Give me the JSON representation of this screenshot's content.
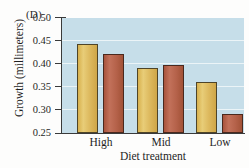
{
  "panel": {
    "letter": "(D)"
  },
  "chart_data": {
    "type": "bar",
    "title": "",
    "subtitle": "",
    "panel_label": "(D)",
    "xlabel": "Diet treatment",
    "ylabel": "Growth (millimeters)",
    "categories": [
      "High",
      "Mid",
      "Low"
    ],
    "ylim": [
      0.25,
      0.5
    ],
    "yticks": [
      0.25,
      0.3,
      0.35,
      0.4,
      0.45,
      0.5
    ],
    "ytick_labels": [
      "0.25",
      "0.30",
      "0.35",
      "0.40",
      "0.45",
      "0.50"
    ],
    "grid": true,
    "grid_color": "#ffffff",
    "legend": "none",
    "plot_background": "#c6dee9",
    "series": [
      {
        "name": "series-1",
        "color": "#ddb95e",
        "values": [
          0.443,
          0.391,
          0.361
        ]
      },
      {
        "name": "series-2",
        "color": "#b5624a",
        "values": [
          0.421,
          0.398,
          0.292
        ]
      }
    ],
    "annotations": []
  }
}
